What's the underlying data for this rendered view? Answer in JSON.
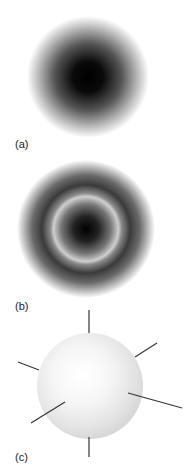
{
  "panels": [
    {
      "id": "a",
      "label": "(a)",
      "description": "Radially symmetric density, dark center fading outward"
    },
    {
      "id": "b",
      "label": "(b)",
      "description": "Radial density with dark core and node ring"
    },
    {
      "id": "c",
      "label": "(c)",
      "description": "Shaded sphere with six radiating axes"
    }
  ],
  "colors": {
    "dark": "#000000",
    "light": "#ffffff",
    "sphere_edge": "#dcdcdc",
    "line": "#333333"
  }
}
